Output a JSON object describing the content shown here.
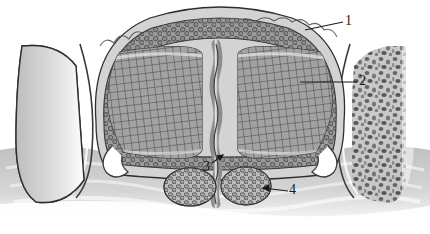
{
  "figure": {
    "style": "grayscale line-and-tone anatomical drawing",
    "background_color": "#ffffff",
    "ink_color": "#1a1a1a",
    "width": 430,
    "height": 234
  },
  "labels": [
    {
      "id": "label-1",
      "text": "1",
      "x": 345,
      "y": 14,
      "leader": {
        "x1": 343,
        "y1": 22,
        "x2": 305,
        "y2": 30
      },
      "target": "outer-cellular-cortex-rim"
    },
    {
      "id": "label-2",
      "text": "2",
      "x": 359,
      "y": 74,
      "leader": {
        "x1": 357,
        "y1": 82,
        "x2": 300,
        "y2": 82
      },
      "target": "central-crosshatched-lobe-right"
    },
    {
      "id": "label-3",
      "text": "3",
      "x": 203,
      "y": 160,
      "leader": {
        "x1": 212,
        "y1": 163,
        "x2": 222,
        "y2": 155
      },
      "target": "median-septum"
    },
    {
      "id": "label-4",
      "text": "4",
      "x": 289,
      "y": 183,
      "leader": {
        "x1": 288,
        "y1": 191,
        "x2": 262,
        "y2": 188
      },
      "target": "follicular-nodule-cluster"
    }
  ],
  "structures": {
    "central_body": {
      "name": "central bilobed body",
      "outline": "scalloped dome spanning approximately x=95..345, y=8..175",
      "rim": {
        "name": "outer cellular cortex rim",
        "cell_shape": "round granular cells",
        "tone": "#8f8f8f"
      },
      "lobes": [
        {
          "name": "left lobe",
          "texture": "crosshatch grid",
          "tone": "#9a9a9a"
        },
        {
          "name": "right lobe",
          "texture": "crosshatch grid",
          "tone": "#9a9a9a"
        }
      ],
      "septum": {
        "name": "median septum",
        "orientation": "vertical",
        "tone": "#d8d8d8"
      }
    },
    "lateral_masses": [
      {
        "name": "left lateral speckled mass",
        "texture": "coarse speckled granules",
        "tone": "#b4b4b4"
      },
      {
        "name": "right lateral speckled mass",
        "texture": "coarse speckled granules",
        "tone": "#b4b4b4"
      }
    ],
    "nodules": [
      {
        "name": "left follicular nodule",
        "cx": 190,
        "cy": 187,
        "rx": 26,
        "ry": 19
      },
      {
        "name": "right follicular nodule",
        "cx": 246,
        "cy": 186,
        "rx": 25,
        "ry": 19
      }
    ],
    "basal_tissue": {
      "name": "basal wavy connective tissue",
      "tone": "#cfcfcf"
    }
  }
}
